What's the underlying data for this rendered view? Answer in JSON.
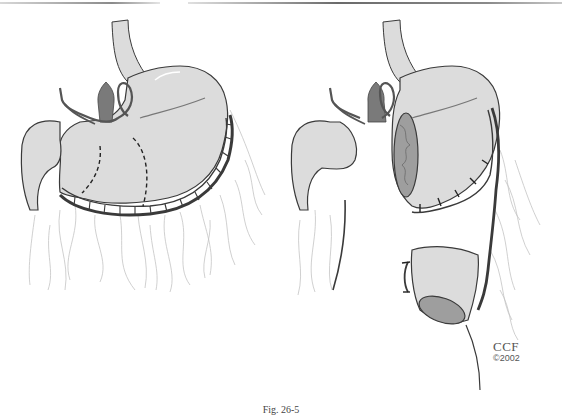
{
  "figure": {
    "panels": [
      {
        "id": "left",
        "label": "Stomach before resection with dashed resection lines",
        "parts": [
          "esophagus",
          "stomach",
          "duodenum",
          "pylorus",
          "gastroepiploic vessels",
          "omentum",
          "dashed resection lines"
        ]
      },
      {
        "id": "right",
        "label": "Stomach after segmental resection with vascular pedicle",
        "parts": [
          "esophagus",
          "proximal stomach with open lumen",
          "duodenum",
          "vascular pedicle",
          "resected gastric segment",
          "omentum"
        ]
      }
    ],
    "credit": {
      "line1": "CCF",
      "line2": "©2002"
    },
    "caption": "Fig. 26-5"
  },
  "colors": {
    "organ_fill": "#dcdcdc",
    "organ_stroke": "#3a3a3a",
    "vessel_dark": "#555555",
    "pylorus_fill": "#7a7a7a",
    "mucosa_fill": "#9e9e9e",
    "omentum_stroke": "#bdbdbd"
  }
}
